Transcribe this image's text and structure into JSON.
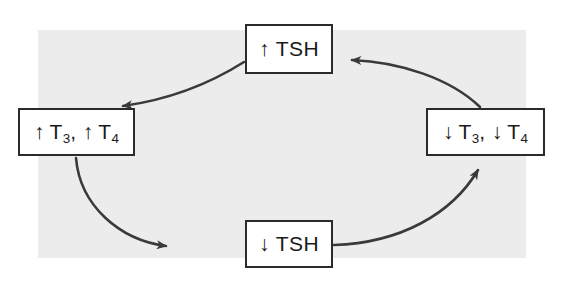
{
  "figure": {
    "width": 561,
    "height": 282,
    "background_color": "#ffffff",
    "panel_color": "#ececec",
    "line_color": "#3a3a3a",
    "box_border_color": "#2b2b2b",
    "text_color": "#1a1a1a"
  },
  "nodes": {
    "top": {
      "id": "tsh-high",
      "arrow_symbol": "↑",
      "label_plain": "↑ TSH",
      "analyte": "TSH",
      "direction": "increased"
    },
    "left": {
      "id": "t3-t4-high",
      "arrow_symbol": "↑",
      "label_plain": "↑ T3, ↑ T4",
      "part_one_arrow": "↑",
      "part_one_base": "T",
      "part_one_sub": "3",
      "separator": ", ",
      "part_two_arrow": "↑",
      "part_two_base": "T",
      "part_two_sub": "4",
      "direction": "increased"
    },
    "right": {
      "id": "t3-t4-low",
      "arrow_symbol": "↓",
      "label_plain": "↓ T3, ↓ T4",
      "part_one_arrow": "↓",
      "part_one_base": "T",
      "part_one_sub": "3",
      "separator": ", ",
      "part_two_arrow": "↓",
      "part_two_base": "T",
      "part_two_sub": "4",
      "direction": "decreased"
    },
    "bottom": {
      "id": "tsh-low",
      "arrow_symbol": "↓",
      "label_plain": "↓ TSH",
      "analyte": "TSH",
      "direction": "decreased"
    }
  },
  "connectors": [
    {
      "id": "top-to-left",
      "from": "top",
      "to": "left",
      "style": "curved-arrow"
    },
    {
      "id": "left-to-bottom",
      "from": "left",
      "to": "bottom",
      "style": "curved-arrow"
    },
    {
      "id": "bottom-to-right",
      "from": "bottom",
      "to": "right",
      "style": "curved-arrow"
    },
    {
      "id": "right-to-top",
      "from": "right",
      "to": "top",
      "style": "curved-arrow"
    }
  ]
}
